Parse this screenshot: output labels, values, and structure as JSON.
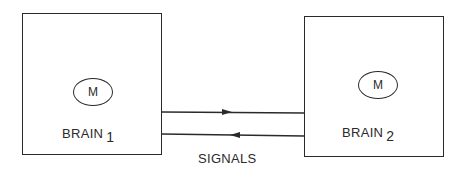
{
  "diagram": {
    "brain1": {
      "module_label": "M",
      "name": "BRAIN",
      "index": "1"
    },
    "brain2": {
      "module_label": "M",
      "name": "BRAIN",
      "index": "2"
    },
    "connection_label": "SIGNALS",
    "arrows": [
      {
        "from": "brain1",
        "to": "brain2",
        "direction": "right"
      },
      {
        "from": "brain2",
        "to": "brain1",
        "direction": "left"
      }
    ]
  }
}
